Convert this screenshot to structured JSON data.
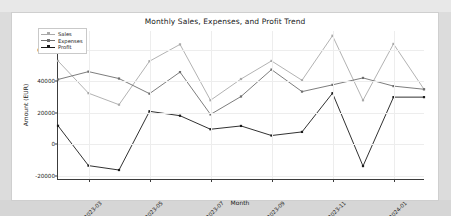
{
  "figure": {
    "title": "Monthly Sales, Expenses, and Profit Trend",
    "background_color": "#ffffff",
    "page_background_color": "#dcdcdc"
  },
  "legend": {
    "position": "upper-left",
    "entries": [
      {
        "label": "Sales",
        "color": "#a9a9a9"
      },
      {
        "label": "Expenses",
        "color": "#6e6e6e"
      },
      {
        "label": "Profit",
        "color": "#1a1a1a"
      }
    ]
  },
  "axes": {
    "xlabel": "Month",
    "ylabel": "Amount (EUR)",
    "y_ticks": [
      "60000",
      "40000",
      "20000",
      "0",
      "-20000"
    ],
    "x_ticks": [
      "2023-03",
      "2023-05",
      "2023-07",
      "2023-09",
      "2023-11",
      "2024-01"
    ],
    "grid": true
  },
  "chart_data": {
    "type": "line",
    "title": "Monthly Sales, Expenses, and Profit Trend",
    "xlabel": "Month",
    "ylabel": "Amount (EUR)",
    "ylim": [
      -22000,
      72000
    ],
    "grid": true,
    "legend_position": "upper left",
    "x": [
      "2023-02",
      "2023-03",
      "2023-04",
      "2023-05",
      "2023-06",
      "2023-07",
      "2023-08",
      "2023-09",
      "2023-10",
      "2023-11",
      "2023-12",
      "2024-01",
      "2024-02"
    ],
    "x_tick_labels": [
      "2023-03",
      "2023-05",
      "2023-07",
      "2023-09",
      "2023-11",
      "2024-01"
    ],
    "series": [
      {
        "name": "Sales",
        "color": "#a9a9a9",
        "marker": "square",
        "values": [
          53000,
          32500,
          25200,
          52800,
          63500,
          28000,
          41500,
          53000,
          40700,
          69000,
          28000,
          63800,
          35000
        ]
      },
      {
        "name": "Expenses",
        "color": "#6e6e6e",
        "marker": "square",
        "values": [
          41200,
          46200,
          41800,
          32200,
          45900,
          19000,
          30400,
          47500,
          33500,
          37800,
          42200,
          37000,
          35000
        ]
      },
      {
        "name": "Profit",
        "color": "#1a1a1a",
        "marker": "square",
        "values": [
          11800,
          -13500,
          -16300,
          21000,
          18200,
          9600,
          11700,
          5600,
          7900,
          32500,
          -13800,
          30000,
          30000
        ]
      }
    ]
  }
}
